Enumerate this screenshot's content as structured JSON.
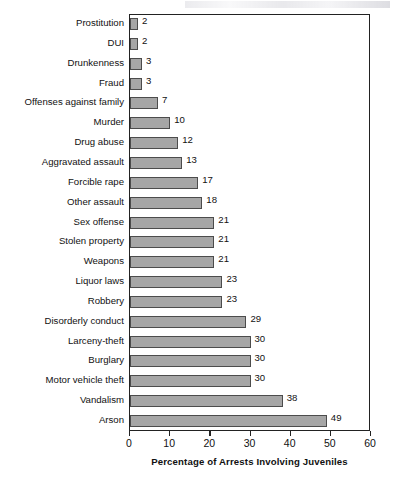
{
  "chart_data": {
    "type": "bar",
    "orientation": "horizontal",
    "title": "",
    "xlabel": "Percentage of Arrests Involving Juveniles",
    "ylabel": "",
    "xlim": [
      0,
      60
    ],
    "xticks": [
      0,
      10,
      20,
      30,
      40,
      50,
      60
    ],
    "grid": false,
    "legend": null,
    "bar_color": "#a6a6a6",
    "bar_border_color": "#4c4c4c",
    "categories": [
      "Prostitution",
      "DUI",
      "Drunkenness",
      "Fraud",
      "Offenses against family",
      "Murder",
      "Drug abuse",
      "Aggravated assault",
      "Forcible rape",
      "Other assault",
      "Sex offense",
      "Stolen property",
      "Weapons",
      "Liquor laws",
      "Robbery",
      "Disorderly conduct",
      "Larceny-theft",
      "Burglary",
      "Motor vehicle theft",
      "Vandalism",
      "Arson"
    ],
    "values": [
      2,
      2,
      3,
      3,
      7,
      10,
      12,
      13,
      17,
      18,
      21,
      21,
      21,
      23,
      23,
      29,
      30,
      30,
      30,
      38,
      49
    ],
    "data_labels": [
      "2",
      "2",
      "3",
      "3",
      "7",
      "10",
      "12",
      "13",
      "17",
      "18",
      "21",
      "21",
      "21",
      "23",
      "23",
      "29",
      "30",
      "30",
      "30",
      "38",
      "49"
    ],
    "xtick_labels": [
      "0",
      "10",
      "20",
      "30",
      "40",
      "50",
      "60"
    ]
  }
}
